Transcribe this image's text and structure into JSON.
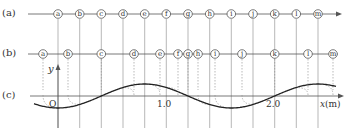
{
  "rows": {
    "a": {
      "label": "(a)",
      "y": 14
    },
    "b": {
      "label": "(b)",
      "y": 54
    },
    "c": {
      "label": "(c)",
      "y": 96
    }
  },
  "particles": [
    "a",
    "b",
    "c",
    "d",
    "e",
    "f",
    "g",
    "h",
    "i",
    "j",
    "k",
    "l",
    "m"
  ],
  "equilibrium_x": [
    58,
    79.7,
    101.3,
    123,
    144.7,
    166.3,
    188,
    209.7,
    231.3,
    253,
    274.7,
    296.3,
    318
  ],
  "displaced_x": [
    43,
    68,
    101.3,
    134,
    160,
    178,
    188,
    198,
    215,
    242,
    274.7,
    308,
    333
  ],
  "axis": {
    "y_label": "y",
    "x_label": "x",
    "x_unit": "(m)",
    "origin_label": "O",
    "tick_labels": [
      {
        "text": "1.0",
        "x": 166.3
      },
      {
        "text": "2.0",
        "x": 274.7
      }
    ]
  },
  "wave": {
    "origin_px": 58,
    "px_per_m": 108.3,
    "wavelength_m": 1.6,
    "amplitude_px": 12,
    "phase": "y = -A cos(2πx/λ)"
  },
  "colors": {
    "line": "#555555",
    "grid": "#9a9a9a",
    "dashed": "#8a8a8a",
    "wave": "#222222",
    "circle_stroke": "#444444"
  }
}
